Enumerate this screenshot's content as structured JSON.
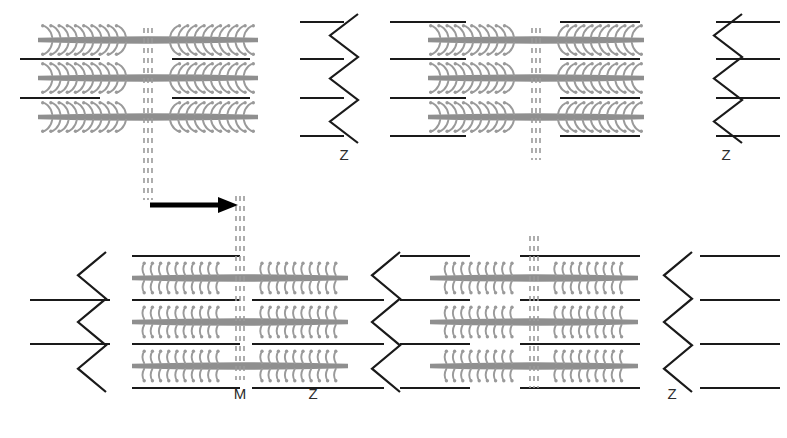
{
  "figure": {
    "width": 787,
    "height": 438,
    "background": "#ffffff"
  },
  "colors": {
    "myosin": "#8f8f8f",
    "myosin_head": "#9a9a9a",
    "actin": "#1a1a1a",
    "z_line": "#1a1a1a",
    "m_line": "#9a9a9a",
    "arrow": "#000000",
    "label_text": "#2b2b2b"
  },
  "states": [
    {
      "id": "relaxed",
      "row": "top",
      "description": "Relaxed state - myosin heads angled and detached",
      "head_style": "angled",
      "sarcomeres": [
        {
          "id": "top-left",
          "m_line_x": 148,
          "label": ""
        },
        {
          "id": "top-right",
          "m_line_x": 536,
          "label": ""
        }
      ],
      "z_lines": [
        {
          "id": "top-z1",
          "x": 344,
          "label": "Z"
        },
        {
          "id": "top-z2",
          "x": 728,
          "label": "Z"
        }
      ]
    },
    {
      "id": "contracted",
      "row": "bottom",
      "description": "Contracted state - myosin heads perpendicular and attached to actin",
      "head_style": "perpendicular",
      "sarcomeres": [
        {
          "id": "bottom-left",
          "m_line_x": 240,
          "label": "M"
        },
        {
          "id": "bottom-right",
          "m_line_x": 534,
          "label": ""
        }
      ],
      "z_lines": [
        {
          "id": "bottom-z1",
          "x": 386,
          "label": "Z"
        },
        {
          "id": "bottom-z2",
          "x": 678,
          "label": "Z"
        }
      ]
    }
  ],
  "labels": [
    {
      "name": "z-label-top-1",
      "text": "Z",
      "x": 344,
      "y": 160
    },
    {
      "name": "z-label-top-2",
      "text": "Z",
      "x": 726,
      "y": 160
    },
    {
      "name": "m-label-bottom",
      "text": "M",
      "x": 240,
      "y": 399
    },
    {
      "name": "z-label-bottom-1",
      "text": "Z",
      "x": 313,
      "y": 399
    },
    {
      "name": "z-label-bottom-2",
      "text": "Z",
      "x": 672,
      "y": 399
    }
  ],
  "arrow": {
    "name": "shift-arrow",
    "direction": "right",
    "x1": 150,
    "x2": 232,
    "y": 205,
    "label": ""
  },
  "guides": [
    {
      "name": "m-line-guide-top",
      "x": 148,
      "y1": 28,
      "y2": 200
    },
    {
      "name": "m-line-guide-bottom",
      "x": 240,
      "y1": 196,
      "y2": 380
    }
  ],
  "legend_semantics": {
    "thick_gray_band": "myosin (thick filament)",
    "thin_black_line": "actin (thin filament)",
    "small_hooks": "myosin heads / cross-bridges",
    "vertical_dashed_triple": "M-line",
    "zigzag": "Z-line / Z-disc"
  }
}
